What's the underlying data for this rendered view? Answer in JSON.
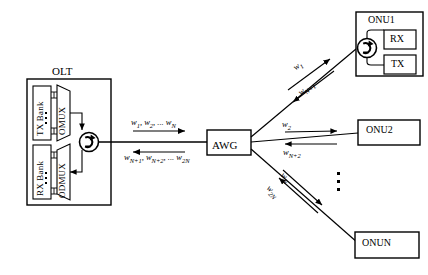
{
  "figure": {
    "type": "network-architecture-diagram"
  },
  "olt": {
    "title": "OLT",
    "tx_bank": "TX Bank",
    "rx_bank": "RX Bank",
    "omux": "OMUX",
    "odmux": "ODMUX",
    "circulator": "circulator"
  },
  "awg": {
    "label": "AWG"
  },
  "trunk": {
    "downstream": "w1, w2, ... wN",
    "downstream_html": "w<sub>1</sub>, w<sub>2</sub>, ... w<sub>N</sub>",
    "upstream": "wN+1, wN+2, ... w2N",
    "upstream_html": "w<sub>N+1</sub>, w<sub>N+2</sub>, ... w<sub>2N</sub>"
  },
  "branches": [
    {
      "onu": "ONU1",
      "downstream": "w1",
      "downstream_html": "w<sub>1</sub>",
      "upstream": "wN+1",
      "upstream_html": "w<sub>N+1</sub>"
    },
    {
      "onu": "ONU2",
      "downstream": "w2",
      "downstream_html": "w<sub>2</sub>",
      "upstream": "wN+2",
      "upstream_html": "w<sub>N+2</sub>"
    },
    {
      "onu": "ONUN",
      "downstream": "wN",
      "downstream_html": "w<sub>N</sub>",
      "upstream": "w2N",
      "upstream_html": "w<sub>2N</sub>"
    }
  ],
  "onu1": {
    "title": "ONU1",
    "rx": "RX",
    "tx": "TX"
  },
  "onu2": {
    "title": "ONU2"
  },
  "onun": {
    "title": "ONUN"
  },
  "ellipsis": {
    "onu_list": "vertical-ellipsis"
  },
  "colors": {
    "stroke": "#000000",
    "background": "#ffffff"
  }
}
